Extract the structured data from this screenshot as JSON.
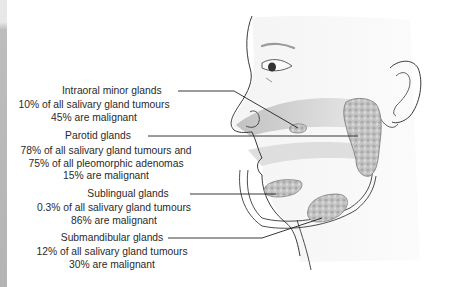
{
  "figure": {
    "labels": [
      {
        "title": "Intraoral minor glands",
        "lines": [
          "10% of all salivary gland  tumours",
          "45% are malignant"
        ]
      },
      {
        "title": "Parotid glands",
        "lines": [
          "78% of all salivary gland tumours and",
          "75% of all pleomorphic adenomas",
          "15% are malignant"
        ]
      },
      {
        "title": "Sublingual glands",
        "lines": [
          "0.3% of all salivary gland tumours",
          "86% are malignant"
        ]
      },
      {
        "title": "Submandibular glands",
        "lines": [
          "12% of all salivary gland tumours",
          "30% are malignant"
        ]
      }
    ],
    "colors": {
      "outline": "#3a3a3a",
      "gland_fill": "#b8b8b8",
      "shading": "#d4d4d4",
      "text": "#2a2a2a"
    }
  }
}
